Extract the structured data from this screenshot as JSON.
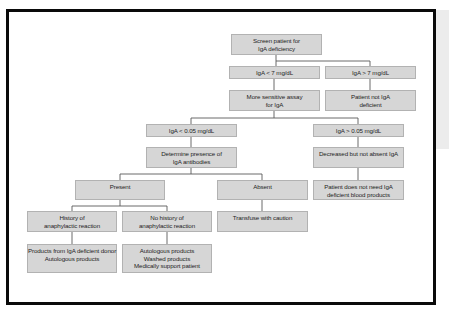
{
  "diagram": {
    "colors": {
      "frame": "#0a0a0a",
      "node_fill": "#d6d6d6",
      "node_border": "#b2b2b2",
      "connector": "#5a5a5a",
      "side_strip": "#ececec"
    },
    "nodes": {
      "screen": {
        "lines": [
          "Screen patient for",
          "IgA deficiency"
        ]
      },
      "iga_lt7": {
        "lines": [
          "IgA < 7 mg/dL"
        ]
      },
      "iga_gt7": {
        "lines": [
          "IgA > 7 mg/dL"
        ]
      },
      "sensitive_assay": {
        "lines": [
          "More sensitive assay",
          "for IgA"
        ]
      },
      "not_deficient": {
        "lines": [
          "Patient not IgA",
          "deficient"
        ]
      },
      "iga_lt005": {
        "lines": [
          "IgA < 0.05 mg/dL"
        ]
      },
      "iga_gt005": {
        "lines": [
          "IgA > 0.05 mg/dL"
        ]
      },
      "determine_antibodies": {
        "lines": [
          "Determine presence of",
          "IgA antibodies"
        ]
      },
      "decreased_not_absent": {
        "lines": [
          "Decreased but not absent IgA"
        ]
      },
      "present": {
        "lines": [
          "Present"
        ]
      },
      "absent": {
        "lines": [
          "Absent"
        ]
      },
      "no_need_products": {
        "lines": [
          "Patient does not need IgA",
          "deficient blood products"
        ]
      },
      "history_anaphylaxis": {
        "lines": [
          "History of",
          "anaphylactic reaction"
        ]
      },
      "no_history_anaphylaxis": {
        "lines": [
          "No history of",
          "anaphylactic reaction"
        ]
      },
      "transfuse_caution": {
        "lines": [
          "Transfuse with caution"
        ]
      },
      "products_donor": {
        "lines": [
          "Products from IgA deficient donor",
          "Autologous products"
        ]
      },
      "products_autologous": {
        "lines": [
          "Autologous products",
          "Washed products",
          "Medically support patient"
        ]
      }
    },
    "edges": [
      [
        "screen",
        "iga_lt7"
      ],
      [
        "screen",
        "iga_gt7"
      ],
      [
        "iga_lt7",
        "sensitive_assay"
      ],
      [
        "iga_gt7",
        "not_deficient"
      ],
      [
        "sensitive_assay",
        "iga_lt005"
      ],
      [
        "sensitive_assay",
        "iga_gt005"
      ],
      [
        "iga_lt005",
        "determine_antibodies"
      ],
      [
        "iga_gt005",
        "decreased_not_absent"
      ],
      [
        "decreased_not_absent",
        "no_need_products"
      ],
      [
        "determine_antibodies",
        "present"
      ],
      [
        "determine_antibodies",
        "absent"
      ],
      [
        "present",
        "history_anaphylaxis"
      ],
      [
        "present",
        "no_history_anaphylaxis"
      ],
      [
        "absent",
        "transfuse_caution"
      ],
      [
        "history_anaphylaxis",
        "products_donor"
      ],
      [
        "no_history_anaphylaxis",
        "products_autologous"
      ]
    ]
  }
}
